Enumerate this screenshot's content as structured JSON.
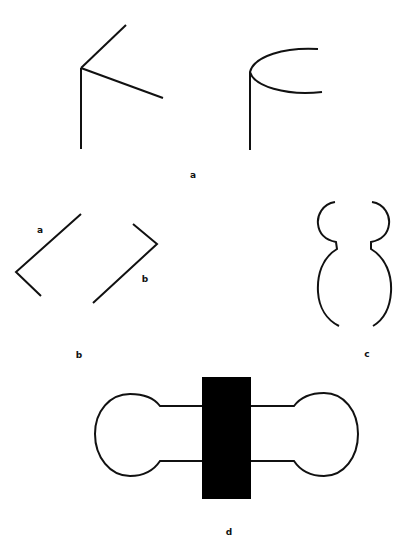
{
  "figure": {
    "panels": [
      {
        "id": "a",
        "label": "a",
        "parts": [
          {
            "name": "fork-junction",
            "description": "vertical line with two branching segments"
          },
          {
            "name": "cylinder-edge",
            "description": "vertical line meeting a curved arc"
          }
        ]
      },
      {
        "id": "b",
        "label": "b",
        "parts": [
          {
            "name": "bracket-a",
            "label": "a"
          },
          {
            "name": "bracket-b",
            "label": "b"
          }
        ]
      },
      {
        "id": "c",
        "label": "c",
        "parts": [
          {
            "name": "vase-contour-left"
          },
          {
            "name": "vase-contour-right"
          }
        ]
      },
      {
        "id": "d",
        "label": "d",
        "parts": [
          {
            "name": "dumbbell-outline"
          },
          {
            "name": "occluding-rectangle"
          }
        ]
      }
    ],
    "colors": {
      "ink": "#111111",
      "fill": "#000000",
      "background": "#ffffff"
    }
  }
}
